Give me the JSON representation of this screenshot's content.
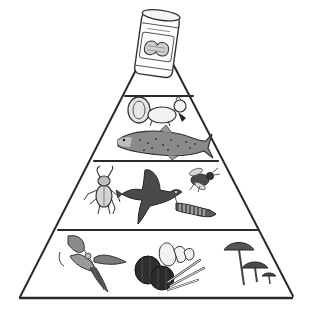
{
  "diagram": {
    "type": "food-pyramid",
    "colors": {
      "outline": "#2a2a2a",
      "ink": "#333333",
      "mid": "#7a7a7a",
      "light": "#bdbdbd",
      "background": "#ffffff"
    },
    "apex": {
      "item": "peanut-butter-jar",
      "description": "Jar of peanut butter with peanut label"
    },
    "tiers": [
      {
        "level": 1,
        "position": "top",
        "items": [
          "squirrel",
          "trout"
        ]
      },
      {
        "level": 2,
        "position": "middle",
        "items": [
          "beetle",
          "bird",
          "bee",
          "caterpillar"
        ]
      },
      {
        "level": 3,
        "position": "bottom",
        "items": [
          "leafy-plant",
          "vegetables-fruits",
          "mushrooms"
        ]
      }
    ]
  }
}
